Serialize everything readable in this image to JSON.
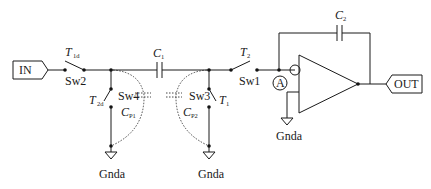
{
  "diagram": {
    "type": "switched-capacitor integrator circuit",
    "ports": {
      "input": "IN",
      "output": "OUT"
    },
    "switches": [
      {
        "id": "sw2",
        "label": "Sw2",
        "phase": "T",
        "phase_sub": "1d"
      },
      {
        "id": "sw4",
        "label": "Sw4",
        "phase": "T",
        "phase_sub": "2d"
      },
      {
        "id": "sw3",
        "label": "Sw3",
        "phase": "T",
        "phase_sub": "1"
      },
      {
        "id": "sw1",
        "label": "Sw1",
        "phase": "T",
        "phase_sub": "2"
      }
    ],
    "capacitors": [
      {
        "id": "c1",
        "label": "C",
        "sub": "1"
      },
      {
        "id": "c2",
        "label": "C",
        "sub": "2"
      }
    ],
    "parasitics": [
      {
        "id": "cp1",
        "label": "C",
        "sub": "P1"
      },
      {
        "id": "cp2",
        "label": "C",
        "sub": "P2"
      }
    ],
    "node_marker": "A",
    "grounds": [
      "Gnda",
      "Gnda",
      "Gnda"
    ]
  }
}
